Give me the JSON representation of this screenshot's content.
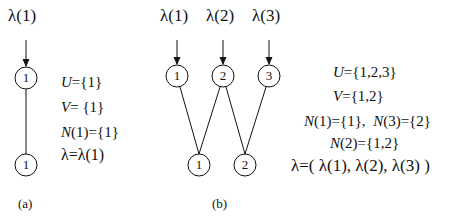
{
  "panel_a": {
    "caption": "(a)",
    "input_label": "λ(1)",
    "top_node": "1",
    "bottom_node": "1",
    "equations": {
      "U_var": "U",
      "U_val": "={1}",
      "V_var": "V",
      "V_val": "= {1}",
      "N_var": "N",
      "N_val": "(1)={1}",
      "lambda_eq": "λ=λ(1)"
    }
  },
  "panel_b": {
    "caption": "(b)",
    "input_labels": [
      "λ(1)",
      "λ(2)",
      "λ(3)"
    ],
    "top_nodes": [
      "1",
      "2",
      "3"
    ],
    "bottom_nodes": [
      "1",
      "2"
    ],
    "edges": [
      [
        1,
        1
      ],
      [
        2,
        1
      ],
      [
        2,
        2
      ],
      [
        3,
        2
      ]
    ],
    "equations": {
      "U_var": "U",
      "U_val": "={1,2,3}",
      "V_var": "V",
      "V_val": "={1,2}",
      "N1_var": "N",
      "N1_val": "(1)={1},",
      "N3_var": "N",
      "N3_val": "(3)={2}",
      "N2_var": "N",
      "N2_val": "(2)={1,2}",
      "lambda_eq": "λ=( λ(1), λ(2), λ(3) )"
    }
  }
}
